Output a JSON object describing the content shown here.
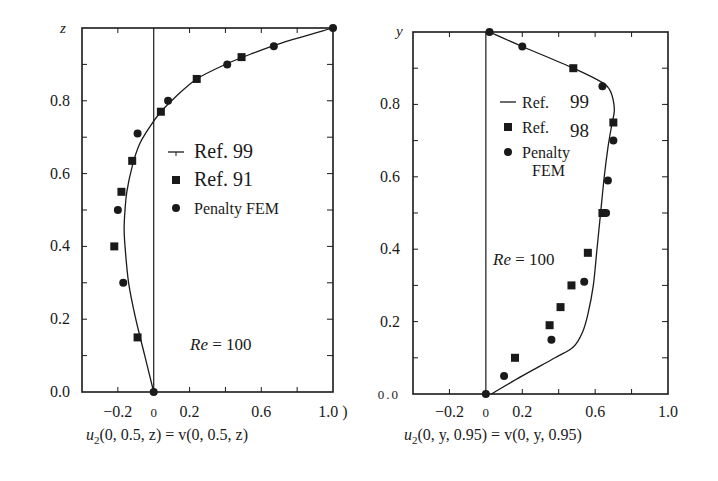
{
  "chart_data": [
    {
      "type": "line",
      "panel": "left",
      "title": "",
      "xlabel": "u2(0, 0.5, z) = v(0, 0.5, z)",
      "xlabel_parts": {
        "u": "u",
        "sub": "2",
        "rest": "(0, 0.5, z)  =  v(0, 0.5, z)"
      },
      "ylabel": "z",
      "xlim": [
        -0.4,
        1.0
      ],
      "ylim": [
        0.0,
        1.0
      ],
      "x_ticks": [
        -0.4,
        -0.2,
        0,
        0.2,
        0.4,
        0.6,
        0.8,
        1.0
      ],
      "x_tick_labels": [
        {
          "value": -0.2,
          "label": "−0.2"
        },
        {
          "value": 0,
          "label": "0"
        },
        {
          "value": 0.2,
          "label": "0.2"
        },
        {
          "value": 0.6,
          "label": "0.6"
        },
        {
          "value": 1.0,
          "label": "1.0 )"
        }
      ],
      "y_ticks": [
        0.1,
        0.2,
        0.3,
        0.4,
        0.5,
        0.6,
        0.7,
        0.8,
        0.9
      ],
      "y_tick_labels": [
        {
          "value": 0.0,
          "label": "0.0"
        },
        {
          "value": 0.2,
          "label": "0.2"
        },
        {
          "value": 0.4,
          "label": "0.4"
        },
        {
          "value": 0.6,
          "label": "0.6"
        },
        {
          "value": 0.8,
          "label": "0.8"
        }
      ],
      "annotation": "Re = 100",
      "legend": [
        {
          "marker": "line",
          "label": "Ref. 99"
        },
        {
          "marker": "square",
          "label": "Ref. 91"
        },
        {
          "marker": "circle",
          "label": "Penalty FEM"
        }
      ],
      "series": [
        {
          "name": "Ref. 99",
          "style": "line",
          "x": [
            0.0,
            -0.05,
            -0.1,
            -0.14,
            -0.16,
            -0.165,
            -0.16,
            -0.15,
            -0.12,
            -0.08,
            -0.02,
            0.04,
            0.12,
            0.24,
            0.4,
            0.55,
            0.72,
            1.0
          ],
          "y": [
            0.0,
            0.1,
            0.2,
            0.3,
            0.4,
            0.45,
            0.5,
            0.55,
            0.62,
            0.68,
            0.73,
            0.77,
            0.81,
            0.86,
            0.9,
            0.93,
            0.96,
            1.0
          ]
        },
        {
          "name": "Ref. 91",
          "style": "square",
          "x": [
            -0.09,
            -0.22,
            -0.18,
            -0.12,
            0.04,
            0.24,
            0.49
          ],
          "y": [
            0.15,
            0.4,
            0.55,
            0.635,
            0.77,
            0.86,
            0.92
          ]
        },
        {
          "name": "Penalty FEM",
          "style": "circle",
          "x": [
            0.0,
            -0.17,
            -0.2,
            -0.09,
            0.08,
            0.41,
            0.67,
            1.0
          ],
          "y": [
            0.0,
            0.3,
            0.5,
            0.71,
            0.8,
            0.9,
            0.95,
            1.0
          ]
        }
      ]
    },
    {
      "type": "line",
      "panel": "right",
      "title": "",
      "xlabel": "u2(0, y, 0.95) = v(0, y, 0.95)",
      "xlabel_parts": {
        "u": "u",
        "sub": "2",
        "rest": "(0, y, 0.95)  =  v(0, y, 0.95)"
      },
      "ylabel": "y",
      "xlim": [
        -0.4,
        1.0
      ],
      "ylim": [
        0.0,
        1.0
      ],
      "x_ticks": [
        -0.4,
        -0.2,
        0,
        0.2,
        0.4,
        0.6,
        0.8,
        1.0
      ],
      "x_tick_labels": [
        {
          "value": -0.2,
          "label": "−0.2"
        },
        {
          "value": 0,
          "label": "0"
        },
        {
          "value": 0.2,
          "label": "0.2"
        },
        {
          "value": 0.6,
          "label": "0.6"
        },
        {
          "value": 1.0,
          "label": "1.0"
        }
      ],
      "y_ticks": [
        0.1,
        0.2,
        0.3,
        0.4,
        0.5,
        0.6,
        0.7,
        0.8,
        0.9
      ],
      "y_tick_labels": [
        {
          "value": 0.0,
          "label": "0.0"
        },
        {
          "value": 0.2,
          "label": "0.2"
        },
        {
          "value": 0.4,
          "label": "0.4"
        },
        {
          "value": 0.6,
          "label": "0.6"
        },
        {
          "value": 0.8,
          "label": "0.8"
        }
      ],
      "annotation": "Re = 100",
      "legend": [
        {
          "marker": "line",
          "label": "Ref. 99"
        },
        {
          "marker": "square",
          "label": "Ref. 98"
        },
        {
          "marker": "circle",
          "label": "Penalty FEM"
        }
      ],
      "series": [
        {
          "name": "Ref. 99",
          "style": "line",
          "x": [
            0.03,
            0.2,
            0.38,
            0.48,
            0.53,
            0.56,
            0.59,
            0.61,
            0.63,
            0.65,
            0.67,
            0.69,
            0.705,
            0.7,
            0.68,
            0.64,
            0.48,
            0.2,
            0.02
          ],
          "y": [
            0.0,
            0.05,
            0.1,
            0.13,
            0.17,
            0.22,
            0.3,
            0.4,
            0.5,
            0.6,
            0.68,
            0.74,
            0.78,
            0.81,
            0.84,
            0.86,
            0.9,
            0.96,
            1.0
          ]
        },
        {
          "name": "Ref. 98",
          "style": "square",
          "x": [
            0.16,
            0.35,
            0.41,
            0.47,
            0.56,
            0.64,
            0.7,
            0.48
          ],
          "y": [
            0.1,
            0.19,
            0.24,
            0.3,
            0.39,
            0.5,
            0.75,
            0.9
          ]
        },
        {
          "name": "Penalty FEM",
          "style": "circle",
          "x": [
            0.0,
            0.1,
            0.36,
            0.54,
            0.66,
            0.67,
            0.7,
            0.64,
            0.2,
            0.02
          ],
          "y": [
            0.0,
            0.05,
            0.15,
            0.31,
            0.5,
            0.59,
            0.7,
            0.85,
            0.96,
            1.0
          ]
        }
      ]
    }
  ]
}
